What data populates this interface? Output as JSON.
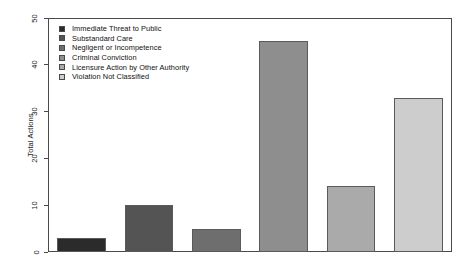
{
  "chart_data": {
    "type": "bar",
    "title": "",
    "xlabel": "",
    "ylabel": "Total Actions",
    "ylim": [
      0,
      50
    ],
    "yticks": [
      0,
      10,
      20,
      30,
      40,
      50
    ],
    "grid": false,
    "legend_position": "top-left",
    "categories": [
      "Immediate Threat to Public",
      "Substandard Care",
      "Negligent or Incompetence",
      "Criminal Conviction",
      "Licensure Action by Other Authority",
      "Violation Not Classified"
    ],
    "values": [
      3,
      10,
      5,
      45,
      14,
      33
    ],
    "colors": [
      "#2b2b2b",
      "#545454",
      "#6e6e6e",
      "#8e8e8e",
      "#aaaaaa",
      "#cdcdcd"
    ],
    "bar_edge_color": "#5a5a5a",
    "axis_color": "#4a4a4a",
    "background": "#ffffff"
  },
  "legend": {
    "items": [
      {
        "label": "Immediate Threat to Public",
        "color": "#2b2b2b"
      },
      {
        "label": "Substandard Care",
        "color": "#545454"
      },
      {
        "label": "Negligent or Incompetence",
        "color": "#6e6e6e"
      },
      {
        "label": "Criminal Conviction",
        "color": "#8e8e8e"
      },
      {
        "label": "Licensure Action by Other Authority",
        "color": "#aaaaaa"
      },
      {
        "label": "Violation Not Classified",
        "color": "#cdcdcd"
      }
    ]
  },
  "axis": {
    "y_label": "Total Actions",
    "y_tick_labels": [
      "0",
      "10",
      "20",
      "30",
      "40",
      "50"
    ]
  }
}
